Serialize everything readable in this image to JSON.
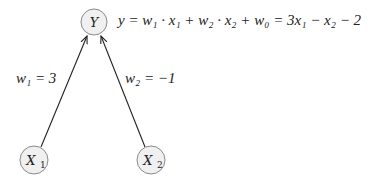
{
  "nodes": {
    "output": {
      "label": "Y",
      "cx": 94,
      "cy": 22
    },
    "input1": {
      "label": "X",
      "sub": "1",
      "cx": 34,
      "cy": 160
    },
    "input2": {
      "label": "X",
      "sub": "2",
      "cx": 151,
      "cy": 160
    }
  },
  "edges": [
    {
      "from": "input1",
      "to": "output",
      "label": "w₁ = 3"
    },
    {
      "from": "input2",
      "to": "output",
      "label": "w₂ = −1"
    }
  ],
  "equation": "y = w₁ · x₁ + w₂ · x₂ + w₀ = 3x₁ − x₂ − 2",
  "colors": {
    "node_fill": "#f0f0f0",
    "node_stroke": "#8a8a8a",
    "edge": "#222222"
  }
}
